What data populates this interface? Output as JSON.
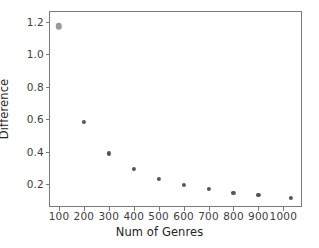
{
  "chart_data": {
    "type": "scatter",
    "title": "",
    "xlabel": "Num of Genres",
    "ylabel": "Difference",
    "xlim": [
      60,
      1075
    ],
    "ylim": [
      0.06,
      1.265
    ],
    "grid": false,
    "legend": null,
    "xticks": [
      100,
      200,
      300,
      400,
      500,
      600,
      700,
      800,
      900,
      1000
    ],
    "xtick_labels": [
      "100",
      "200",
      "300",
      "400",
      "500",
      "600",
      "700",
      "800",
      "900",
      "1000"
    ],
    "yticks": [
      0.2,
      0.4,
      0.6,
      0.8,
      1.0,
      1.2
    ],
    "ytick_labels": [
      "0.2",
      "0.4",
      "0.6",
      "0.8",
      "1.0",
      "1.2"
    ],
    "series": [
      {
        "name": "Difference",
        "marker_color": "#555555",
        "points": [
          {
            "x": 100,
            "y": 1.17,
            "style": "first"
          },
          {
            "x": 200,
            "y": 0.585,
            "style": "normal"
          },
          {
            "x": 300,
            "y": 0.39,
            "style": "normal"
          },
          {
            "x": 400,
            "y": 0.295,
            "style": "normal"
          },
          {
            "x": 500,
            "y": 0.235,
            "style": "normal"
          },
          {
            "x": 600,
            "y": 0.196,
            "style": "normal"
          },
          {
            "x": 700,
            "y": 0.17,
            "style": "normal"
          },
          {
            "x": 800,
            "y": 0.148,
            "style": "normal"
          },
          {
            "x": 900,
            "y": 0.132,
            "style": "normal"
          },
          {
            "x": 1030,
            "y": 0.115,
            "style": "normal"
          }
        ]
      }
    ],
    "colors": {
      "axis": "#7a7a7a",
      "tick_text": "#3d3d3d",
      "axis_title": "#242424",
      "marker": "#555555",
      "marker_highlight": "#9a9a9a",
      "background": "#ffffff"
    }
  }
}
